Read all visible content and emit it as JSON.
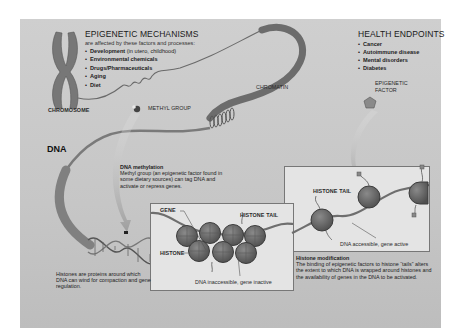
{
  "epigenetic_mechanisms": {
    "title": "EPIGENETIC MECHANISMS",
    "subtitle": "are affected by these factors and processes:",
    "items": [
      {
        "label": "Development",
        "note": " (in utero, childhood)"
      },
      {
        "label": "Environmental chemicals",
        "note": ""
      },
      {
        "label": "Drugs/Pharmaceuticals",
        "note": ""
      },
      {
        "label": "Aging",
        "note": ""
      },
      {
        "label": "Diet",
        "note": ""
      }
    ]
  },
  "health_endpoints": {
    "title": "HEALTH ENDPOINTS",
    "items": [
      "Cancer",
      "Autoimmune disease",
      "Mental disorders",
      "Diabetes"
    ]
  },
  "labels": {
    "chromosome": "CHROMOSOME",
    "chromatin": "CHROMATIN",
    "methyl_group": "METHYL GROUP",
    "epigenetic_factor_line1": "EPIGENETIC",
    "epigenetic_factor_line2": "FACTOR",
    "dna": "DNA",
    "gene": "GENE",
    "histone": "HISTONE",
    "histone_tail_inactive": "HISTONE TAIL",
    "histone_tail_active": "HISTONE TAIL",
    "dna_inaccessible": "DNA inaccessible, gene inactive",
    "dna_accessible": "DNA accessible, gene active"
  },
  "dna_methylation": {
    "title": "DNA methylation",
    "body": "Methyl group (an epigenetic factor found in some dietary sources) can tag DNA and activate or repress genes."
  },
  "histone_modification": {
    "title": "Histone modification",
    "body": "The binding of epigenetic factors to histone “tails” alters the extent to which DNA is wrapped around histones and the availability of genes in the DNA to be activated."
  },
  "histones_note": "Histones are proteins around which DNA can wind for compaction and gene regulation.",
  "colors": {
    "panel_bg": "#c8c8c8",
    "box_bg": "#e4e4e4",
    "histone": "#6e6e6e",
    "strand": "#7a7a7a",
    "text": "#222222"
  }
}
